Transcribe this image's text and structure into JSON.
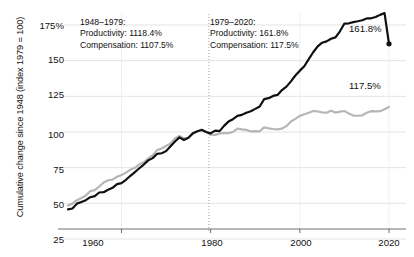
{
  "chart_data": {
    "type": "line",
    "title": "",
    "xlabel": "",
    "ylabel": "Cumulative change since 1948 (index 1979 = 100)",
    "xlim": [
      1948,
      2020
    ],
    "ylim": [
      22,
      180
    ],
    "grid": true,
    "legend_position": "none",
    "y_ticks": [
      {
        "value": 175,
        "label": "175%"
      },
      {
        "value": 150,
        "label": "150"
      },
      {
        "value": 125,
        "label": "125"
      },
      {
        "value": 100,
        "label": "100"
      },
      {
        "value": 75,
        "label": "75"
      },
      {
        "value": 50,
        "label": "50"
      },
      {
        "value": 25,
        "label": "25"
      }
    ],
    "x_ticks": [
      {
        "value": 1960,
        "label": "1960"
      },
      {
        "value": 1980,
        "label": "1980"
      },
      {
        "value": 2000,
        "label": "2000"
      },
      {
        "value": 2020,
        "label": "2020"
      }
    ],
    "reference_line": {
      "x": 1979,
      "style": "dotted",
      "color": "#9a9a9a"
    },
    "series": [
      {
        "name": "Productivity",
        "color": "#101010",
        "width": 2.2,
        "end_marker": true,
        "x": [
          1948,
          1949,
          1950,
          1951,
          1952,
          1953,
          1954,
          1955,
          1956,
          1957,
          1958,
          1959,
          1960,
          1961,
          1962,
          1963,
          1964,
          1965,
          1966,
          1967,
          1968,
          1969,
          1970,
          1971,
          1972,
          1973,
          1974,
          1975,
          1976,
          1977,
          1978,
          1979,
          1980,
          1981,
          1982,
          1983,
          1984,
          1985,
          1986,
          1987,
          1988,
          1989,
          1990,
          1991,
          1992,
          1993,
          1994,
          1995,
          1996,
          1997,
          1998,
          1999,
          2000,
          2001,
          2002,
          2003,
          2004,
          2005,
          2006,
          2007,
          2008,
          2009,
          2010,
          2011,
          2012,
          2013,
          2014,
          2015,
          2016,
          2017,
          2018,
          2019,
          2020
        ],
        "y": [
          45.8,
          46.4,
          49.8,
          51.0,
          52.2,
          54.3,
          55.1,
          57.6,
          57.8,
          59.5,
          60.9,
          63.5,
          64.2,
          66.5,
          69.3,
          71.9,
          74.6,
          77.2,
          80.1,
          81.7,
          84.7,
          85.1,
          86.6,
          90.0,
          93.3,
          96.2,
          94.4,
          95.9,
          99.1,
          100.5,
          101.4,
          100.0,
          99.0,
          101.0,
          100.6,
          104.3,
          107.3,
          109.0,
          111.3,
          112.0,
          113.5,
          114.6,
          116.2,
          117.9,
          123.0,
          123.7,
          125.3,
          126.0,
          129.4,
          131.8,
          135.5,
          139.6,
          143.0,
          146.1,
          151.1,
          155.9,
          160.0,
          162.6,
          163.5,
          165.4,
          166.3,
          170.6,
          176.0,
          176.2,
          177.0,
          177.6,
          178.3,
          179.6,
          179.7,
          180.6,
          182.1,
          183.4,
          161.8
        ]
      },
      {
        "name": "Compensation",
        "color": "#b6b6b6",
        "width": 2.2,
        "end_marker": false,
        "x": [
          1948,
          1949,
          1950,
          1951,
          1952,
          1953,
          1954,
          1955,
          1956,
          1957,
          1958,
          1959,
          1960,
          1961,
          1962,
          1963,
          1964,
          1965,
          1966,
          1967,
          1968,
          1969,
          1970,
          1971,
          1972,
          1973,
          1974,
          1975,
          1976,
          1977,
          1978,
          1979,
          1980,
          1981,
          1982,
          1983,
          1984,
          1985,
          1986,
          1987,
          1988,
          1989,
          1990,
          1991,
          1992,
          1993,
          1994,
          1995,
          1996,
          1997,
          1998,
          1999,
          2000,
          2001,
          2002,
          2003,
          2004,
          2005,
          2006,
          2007,
          2008,
          2009,
          2010,
          2011,
          2012,
          2013,
          2014,
          2015,
          2016,
          2017,
          2018,
          2019,
          2020
        ],
        "y": [
          48.5,
          49.8,
          52.2,
          53.8,
          55.5,
          58.6,
          59.3,
          61.8,
          64.6,
          66.1,
          66.6,
          68.6,
          69.9,
          71.5,
          73.6,
          74.9,
          77.3,
          78.8,
          81.5,
          83.8,
          87.3,
          88.5,
          90.2,
          92.0,
          95.4,
          97.3,
          95.5,
          95.9,
          98.6,
          100.4,
          101.8,
          100.0,
          98.1,
          98.0,
          99.0,
          99.3,
          99.2,
          100.0,
          102.4,
          101.9,
          101.5,
          100.4,
          100.6,
          100.5,
          103.2,
          102.6,
          102.1,
          101.8,
          102.4,
          104.1,
          107.4,
          109.2,
          111.3,
          112.4,
          113.5,
          114.7,
          114.4,
          113.8,
          113.5,
          114.9,
          113.6,
          114.3,
          114.7,
          112.9,
          111.5,
          111.4,
          111.7,
          113.5,
          114.6,
          114.4,
          114.6,
          116.0,
          117.5
        ]
      }
    ],
    "annotations": [
      {
        "name": "period-1948-1979",
        "lines": [
          "1948–1979:",
          "Productivity: 1118.4%",
          "Compensation: 1107.5%"
        ],
        "x_px": 80,
        "y_px": 17
      },
      {
        "name": "period-1979-2020",
        "lines": [
          "1979–2020:",
          "Productivity: 161.8%",
          "Compensation: 117.5%"
        ],
        "x_px": 210,
        "y_px": 17
      }
    ],
    "end_labels": [
      {
        "name": "productivity-end-label",
        "text": "161.8%",
        "x_px": 349,
        "y_px": 23,
        "color": "#101010"
      },
      {
        "name": "compensation-end-label",
        "text": "117.5%",
        "x_px": 349,
        "y_px": 80,
        "color": "#101010"
      }
    ]
  }
}
